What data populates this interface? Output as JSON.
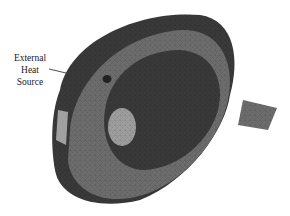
{
  "figure": {
    "annotation": {
      "line1": "External",
      "line2": "Heat",
      "line3": "Source"
    },
    "colors": {
      "dark_region": "#3a3a3a",
      "mid_region": "#6e6e6e",
      "light_region": "#a0a0a0",
      "background": "#ffffff"
    }
  }
}
